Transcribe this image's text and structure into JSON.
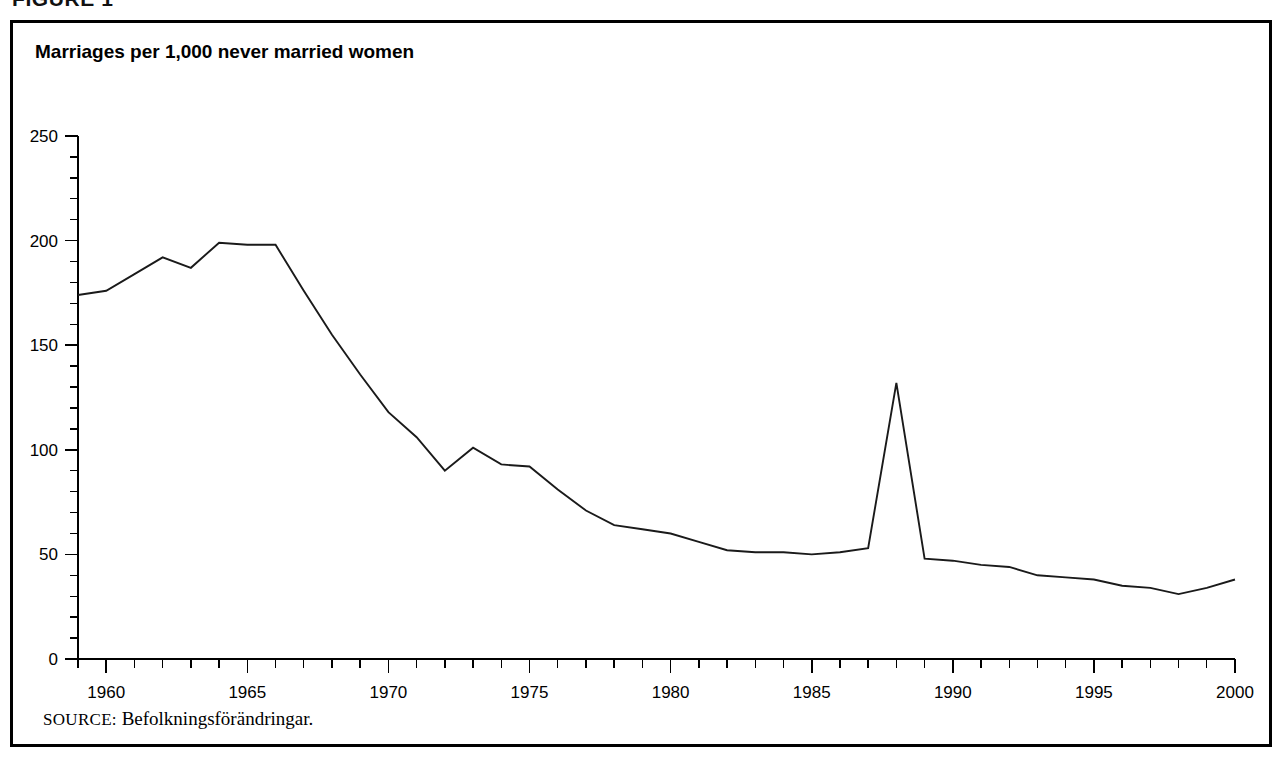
{
  "figure": {
    "caption": "FIGURE 1",
    "title": "Marriages per 1,000 never married women",
    "source_label": "SOURCE:",
    "source_text": "Befolkningsförändringar."
  },
  "chart_data": {
    "type": "line",
    "title": "Marriages per 1,000 never married women",
    "xlabel": "",
    "ylabel": "",
    "xlim": [
      1959,
      2000
    ],
    "ylim": [
      0,
      250
    ],
    "y_ticks": [
      0,
      50,
      100,
      150,
      200,
      250
    ],
    "y_minor_tick_step": 10,
    "x_ticks": [
      1960,
      1965,
      1970,
      1975,
      1980,
      1985,
      1990,
      1995,
      2000
    ],
    "x_minor_tick_step": 1,
    "grid": false,
    "legend": null,
    "line_color": "#1a1a1a",
    "series": [
      {
        "name": "Marriages per 1,000 never married women",
        "x": [
          1959,
          1960,
          1961,
          1962,
          1963,
          1964,
          1965,
          1966,
          1967,
          1968,
          1969,
          1970,
          1971,
          1972,
          1973,
          1974,
          1975,
          1976,
          1977,
          1978,
          1979,
          1980,
          1981,
          1982,
          1983,
          1984,
          1985,
          1986,
          1987,
          1988,
          1989,
          1990,
          1991,
          1992,
          1993,
          1994,
          1995,
          1996,
          1997,
          1998,
          1999,
          2000
        ],
        "values": [
          174,
          176,
          184,
          192,
          187,
          199,
          198,
          198,
          176,
          155,
          136,
          118,
          106,
          90,
          101,
          93,
          92,
          81,
          71,
          64,
          62,
          60,
          56,
          52,
          51,
          51,
          50,
          51,
          53,
          132,
          48,
          47,
          45,
          44,
          40,
          39,
          38,
          35,
          34,
          31,
          34,
          38
        ]
      }
    ],
    "annotations": [
      {
        "label": "spike",
        "x": 1988,
        "y": 132
      }
    ]
  }
}
